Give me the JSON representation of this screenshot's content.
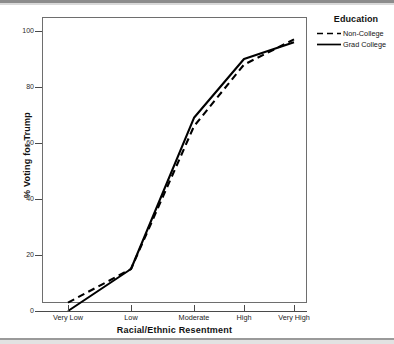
{
  "chart_data": {
    "type": "line",
    "title": "",
    "xlabel": "Racial/Ethnic Resentment",
    "ylabel": "% Voting for Trump",
    "categories": [
      "Very Low",
      "Low",
      "Moderate",
      "High",
      "Very High"
    ],
    "ylim": [
      0,
      100
    ],
    "yticks": [
      0,
      20,
      40,
      60,
      80,
      100
    ],
    "grid": false,
    "legend_position": "right",
    "legend_title": "Education",
    "series": [
      {
        "name": "Non-College",
        "style": "dashed",
        "color": "#000000",
        "values": [
          3,
          15,
          66,
          88,
          97
        ]
      },
      {
        "name": "Grad College",
        "style": "solid",
        "color": "#000000",
        "values": [
          0,
          15,
          69,
          90,
          96
        ]
      }
    ]
  },
  "axes": {
    "y_tick_labels": [
      "0",
      "20",
      "40",
      "60",
      "80",
      "100"
    ],
    "x_tick_labels": [
      "Very Low",
      "Low",
      "Moderate",
      "High",
      "Very High"
    ],
    "y_title": "% Voting for Trump",
    "x_title": "Racial/Ethnic Resentment"
  },
  "legend": {
    "title": "Education",
    "entries": [
      {
        "label": "Non-College",
        "style": "dashed"
      },
      {
        "label": "Grad College",
        "style": "solid"
      }
    ]
  }
}
